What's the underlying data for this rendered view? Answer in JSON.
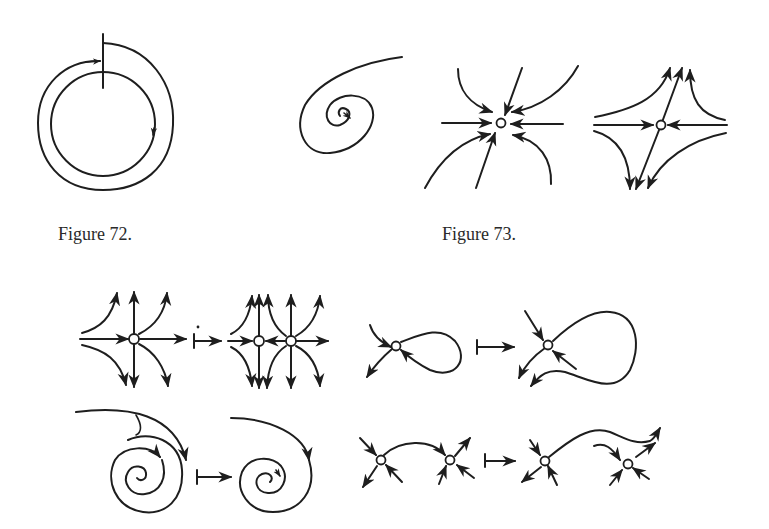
{
  "page": {
    "background": "#ffffff",
    "ink_color": "#1e1e1e"
  },
  "figures": [
    {
      "id": "figure-72",
      "caption": "Figure 72.",
      "panels": [
        {
          "name": "cycle-with-transversal",
          "description": "closed circular orbit with a spiral trajectory approaching it and a vertical transversal segment"
        },
        {
          "name": "focus-spiral",
          "description": "trajectory spiraling into a focus"
        }
      ]
    },
    {
      "id": "figure-73",
      "caption": "Figure 73.",
      "panels": [
        {
          "name": "stable-node",
          "description": "equilibrium point with all trajectories entering"
        },
        {
          "name": "saddle",
          "description": "saddle point with two incoming and two outgoing separatrices"
        }
      ]
    },
    {
      "id": "bifurcation-diagrams",
      "caption": "",
      "panels": [
        {
          "name": "saddle-node-splitting",
          "description": "degenerate point splits into two points",
          "map_symbol": "↦"
        },
        {
          "name": "separatrix-loop-breaking",
          "description": "homoclinic loop of saddle breaks",
          "map_symbol": "↦"
        },
        {
          "name": "spiral-cycle-vanishing",
          "description": "cycle disappears, spiral remains",
          "map_symbol": "↦"
        },
        {
          "name": "saddle-connection-breaking",
          "description": "separatrix connecting two saddles breaks",
          "map_symbol": "↦"
        }
      ]
    }
  ]
}
